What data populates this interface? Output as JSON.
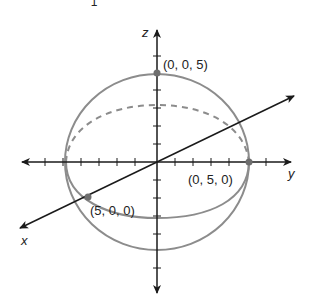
{
  "diagram": {
    "title_fragment": "1",
    "axes": {
      "x": {
        "label": "x"
      },
      "y": {
        "label": "y"
      },
      "z": {
        "label": "z"
      }
    },
    "points": [
      {
        "label": "(0, 0, 5)",
        "axis": "z"
      },
      {
        "label": "(0, 5, 0)",
        "axis": "y"
      },
      {
        "label": "(5, 0, 0)",
        "axis": "x"
      }
    ],
    "colors": {
      "axis": "#1a1a1a",
      "sphere": "#8c8c8c",
      "point": "#6e6e6e",
      "background": "#ffffff"
    }
  }
}
